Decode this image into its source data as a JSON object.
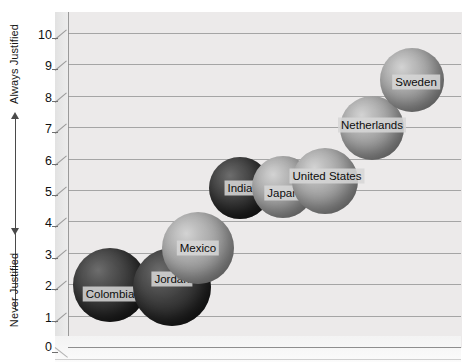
{
  "axis": {
    "top_caption": "Always Justified",
    "bottom_caption": "Never Justified",
    "tick_labels": [
      "10",
      "9",
      "8",
      "7",
      "6",
      "5",
      "4",
      "3",
      "2",
      "1",
      "0"
    ]
  },
  "chart_data": {
    "type": "scatter",
    "title": "",
    "xlabel": "",
    "ylabel": "",
    "ylim": [
      0,
      10
    ],
    "grid": true,
    "legend": "none",
    "y_axis_top_annotation": "Always Justified",
    "y_axis_bottom_annotation": "Never Justified",
    "y_ticks": [
      0,
      1,
      2,
      3,
      4,
      5,
      6,
      7,
      8,
      9,
      10
    ],
    "categories": [
      "Colombia",
      "Jordan",
      "Mexico",
      "India",
      "Japan",
      "United States",
      "Netherlands",
      "Sweden"
    ],
    "values": [
      2.4,
      2.6,
      3.2,
      5.1,
      5.1,
      5.4,
      7.1,
      8.6
    ],
    "points": [
      {
        "label": "Colombia",
        "value": 2.4,
        "shade": "dark"
      },
      {
        "label": "Jordan",
        "value": 2.6,
        "shade": "dark"
      },
      {
        "label": "Mexico",
        "value": 3.2,
        "shade": "mid"
      },
      {
        "label": "India",
        "value": 5.1,
        "shade": "dark"
      },
      {
        "label": "Japan",
        "value": 5.1,
        "shade": "mid"
      },
      {
        "label": "United States",
        "value": 5.4,
        "shade": "mid"
      },
      {
        "label": "Netherlands",
        "value": 7.1,
        "shade": "mid"
      },
      {
        "label": "Sweden",
        "value": 8.6,
        "shade": "mid"
      }
    ]
  },
  "bubbles": [
    {
      "label": "Colombia",
      "cx": 110,
      "cy": 285,
      "r": 37,
      "shade": "dark",
      "lx": 0,
      "ly": 9
    },
    {
      "label": "Jordan",
      "cx": 172,
      "cy": 287,
      "r": 39,
      "shade": "dark",
      "lx": 0,
      "ly": -8
    },
    {
      "label": "Mexico",
      "cx": 198,
      "cy": 248,
      "r": 36,
      "shade": "mid",
      "lx": 0,
      "ly": 0
    },
    {
      "label": "India",
      "cx": 240,
      "cy": 188,
      "r": 31,
      "shade": "dark",
      "lx": 0,
      "ly": 0
    },
    {
      "label": "Japan",
      "cx": 283,
      "cy": 187,
      "r": 31,
      "shade": "mid",
      "lx": 0,
      "ly": 6
    },
    {
      "label": "United States",
      "cx": 325,
      "cy": 181,
      "r": 33,
      "shade": "mid",
      "lx": 2,
      "ly": -5
    },
    {
      "label": "Netherlands",
      "cx": 372,
      "cy": 128,
      "r": 32,
      "shade": "mid",
      "lx": 0,
      "ly": -3
    },
    {
      "label": "Sweden",
      "cx": 412,
      "cy": 80,
      "r": 32,
      "shade": "mid",
      "lx": 4,
      "ly": 2
    }
  ],
  "colors": {
    "plot_background": "#eceaea",
    "gridline": "#8e8e8e",
    "bubble_dark": "#282828",
    "bubble_mid": "#a3a3a3",
    "label_background": "#d6d6d6",
    "text": "#111111"
  }
}
